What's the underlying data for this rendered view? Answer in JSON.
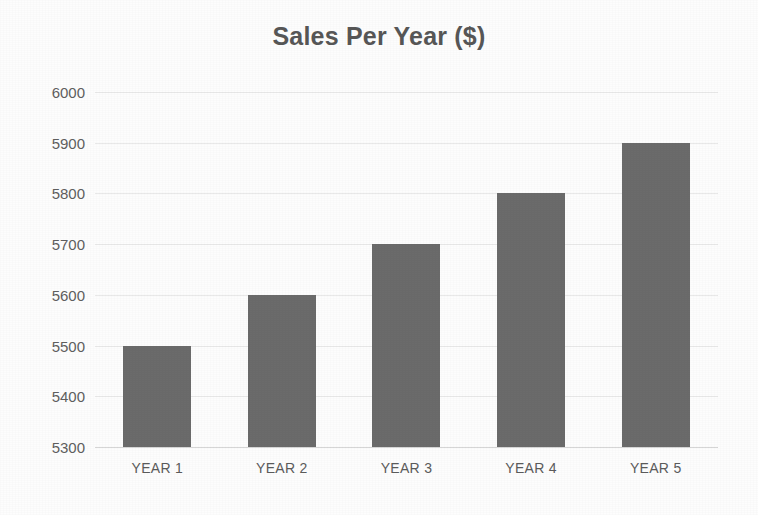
{
  "chart_data": {
    "type": "bar",
    "title": "Sales Per Year ($)",
    "xlabel": "",
    "ylabel": "",
    "categories": [
      "YEAR 1",
      "YEAR 2",
      "YEAR 3",
      "YEAR 4",
      "YEAR 5"
    ],
    "values": [
      5500,
      5600,
      5700,
      5800,
      5900
    ],
    "ylim": [
      5300,
      6000
    ],
    "ytick_step": 100,
    "yticks": [
      6000,
      5900,
      5800,
      5700,
      5600,
      5500,
      5400,
      5300
    ],
    "ytick_labels": [
      "6000",
      "5900",
      "5800",
      "5700",
      "5600",
      "5500",
      "5400",
      "5300"
    ],
    "grid": true,
    "grid_axis": "y",
    "legend": false,
    "legend_position": "none",
    "bar_color": "#6b6b6b",
    "gridline_color": "#e9e9e9",
    "title_color": "#575757",
    "tick_label_color": "#5e5e5e",
    "background_color": "#fdfdfd"
  }
}
